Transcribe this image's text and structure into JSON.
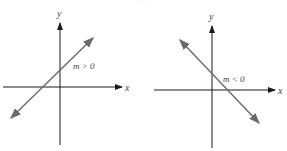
{
  "diagram": {
    "top_cropped_text": "· · ·",
    "panels": [
      {
        "id": "positive-slope",
        "x_label": "x",
        "y_label": "y",
        "slope_label": "m > 0",
        "line": {
          "from": [
            11,
            118
          ],
          "to": [
            93,
            38
          ]
        }
      },
      {
        "id": "negative-slope",
        "x_label": "x",
        "y_label": "y",
        "slope_label": "m < 0",
        "line": {
          "from": [
            180,
            40
          ],
          "to": [
            259,
            123
          ]
        }
      }
    ],
    "colors": {
      "axis": "#1a1a1a",
      "line": "#6a6a6a",
      "label": "#444444"
    }
  }
}
